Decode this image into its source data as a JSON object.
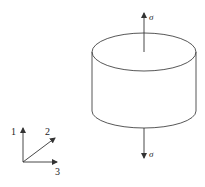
{
  "diagram": {
    "stress_top_label": "σ",
    "stress_bottom_label": "σ",
    "axes": {
      "axis1_label": "1",
      "axis2_label": "2",
      "axis3_label": "3"
    },
    "line_color": "#333333"
  }
}
